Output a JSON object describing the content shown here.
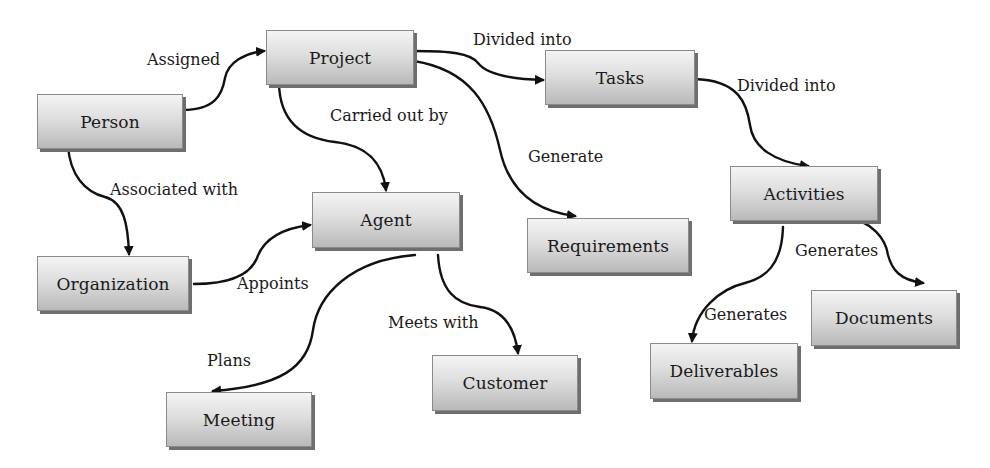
{
  "diagram": {
    "type": "concept-map",
    "nodes": {
      "person": "Person",
      "project": "Project",
      "tasks": "Tasks",
      "activities": "Activities",
      "organization": "Organization",
      "agent": "Agent",
      "requirements": "Requirements",
      "meeting": "Meeting",
      "customer": "Customer",
      "deliverables": "Deliverables",
      "documents": "Documents"
    },
    "edge_labels": {
      "person_project": "Assigned",
      "project_tasks": "Divided into",
      "tasks_activities": "Divided into",
      "project_agent": "Carried out by",
      "project_requirements": "Generate",
      "person_organization": "Associated with",
      "organization_agent": "Appoints",
      "agent_meeting": "Plans",
      "agent_customer": "Meets with",
      "activities_deliverables": "Generates",
      "activities_documents": "Generates"
    },
    "edges": [
      {
        "from": "Person",
        "to": "Project",
        "label": "Assigned"
      },
      {
        "from": "Project",
        "to": "Tasks",
        "label": "Divided into"
      },
      {
        "from": "Tasks",
        "to": "Activities",
        "label": "Divided into"
      },
      {
        "from": "Project",
        "to": "Agent",
        "label": "Carried out by"
      },
      {
        "from": "Project",
        "to": "Requirements",
        "label": "Generate"
      },
      {
        "from": "Person",
        "to": "Organization",
        "label": "Associated with"
      },
      {
        "from": "Organization",
        "to": "Agent",
        "label": "Appoints"
      },
      {
        "from": "Agent",
        "to": "Meeting",
        "label": "Plans"
      },
      {
        "from": "Agent",
        "to": "Customer",
        "label": "Meets with"
      },
      {
        "from": "Activities",
        "to": "Deliverables",
        "label": "Generates"
      },
      {
        "from": "Activities",
        "to": "Documents",
        "label": "Generates"
      }
    ],
    "colors": {
      "node_top": "#f4f4f4",
      "node_bottom": "#b9b9b9",
      "node_shadow": "#6e6e6e",
      "edge": "#111111",
      "background": "#ffffff"
    }
  }
}
